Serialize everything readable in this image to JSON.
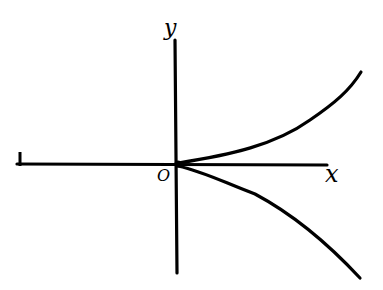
{
  "diagram": {
    "type": "curve-on-axes",
    "labels": {
      "y_axis": "y",
      "x_axis": "x",
      "origin": "O"
    },
    "colors": {
      "ink": "#000000",
      "background": "#ffffff"
    }
  }
}
